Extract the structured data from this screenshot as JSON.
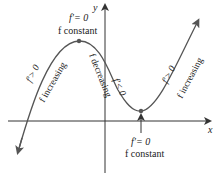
{
  "axes": {
    "x_label": "x",
    "y_label": "y"
  },
  "colors": {
    "curve": "#555555",
    "axis": "#333333",
    "text": "#222222",
    "point": "#555555"
  },
  "annotations": {
    "max_derivative": "f′= 0",
    "max_state": "f  constant",
    "min_derivative": "f′= 0",
    "min_state": "f  constant",
    "left_derivative": "f′> 0",
    "left_state": "f increasing",
    "middle_derivative": "f′< 0",
    "middle_state": "f decreasing",
    "right_derivative": "f′> 0",
    "right_state": "f  increasing"
  }
}
